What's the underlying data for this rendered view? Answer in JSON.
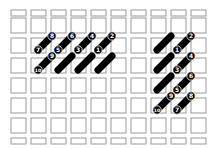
{
  "diagram": {
    "grid": {
      "cols": 10,
      "rows": 7,
      "origin_x": 9,
      "origin_y": 10,
      "pitch": 20,
      "cell": 15
    },
    "colors": {
      "grid": "#9a9a9a",
      "stitch": "#000000",
      "label_bg": "#000000",
      "label_text": "#ffffff"
    },
    "left_group": {
      "stitches": [
        {
          "x1": 38,
          "y1": 50,
          "x2": 52,
          "y2": 36,
          "start": "7",
          "end": "8"
        },
        {
          "x1": 58,
          "y1": 50,
          "x2": 72,
          "y2": 36,
          "start": "5",
          "end": "6"
        },
        {
          "x1": 78,
          "y1": 50,
          "x2": 92,
          "y2": 36,
          "start": "3",
          "end": "4"
        },
        {
          "x1": 98,
          "y1": 50,
          "x2": 112,
          "y2": 36,
          "start": "1",
          "end": "2"
        },
        {
          "x1": 38,
          "y1": 70,
          "x2": 52,
          "y2": 56,
          "start": "10",
          "end": "9"
        },
        {
          "x1": 58,
          "y1": 70,
          "x2": 72,
          "y2": 56,
          "start": "",
          "end": ""
        },
        {
          "x1": 78,
          "y1": 70,
          "x2": 92,
          "y2": 56,
          "start": "",
          "end": ""
        },
        {
          "x1": 98,
          "y1": 70,
          "x2": 112,
          "y2": 56,
          "start": "",
          "end": ""
        }
      ]
    },
    "right_group": {
      "stitches": [
        {
          "x1": 157,
          "y1": 50,
          "x2": 171,
          "y2": 36,
          "start": "",
          "end": ""
        },
        {
          "x1": 177,
          "y1": 50,
          "x2": 191,
          "y2": 36,
          "start": "1",
          "end": "2"
        },
        {
          "x1": 157,
          "y1": 70,
          "x2": 171,
          "y2": 56,
          "start": "",
          "end": ""
        },
        {
          "x1": 177,
          "y1": 70,
          "x2": 191,
          "y2": 56,
          "start": "3",
          "end": "4"
        },
        {
          "x1": 157,
          "y1": 90,
          "x2": 171,
          "y2": 76,
          "start": "",
          "end": ""
        },
        {
          "x1": 177,
          "y1": 90,
          "x2": 191,
          "y2": 76,
          "start": "5",
          "end": "6"
        },
        {
          "x1": 157,
          "y1": 110,
          "x2": 171,
          "y2": 96,
          "start": "10",
          "end": "9"
        },
        {
          "x1": 177,
          "y1": 110,
          "x2": 191,
          "y2": 96,
          "start": "7",
          "end": "8"
        }
      ]
    }
  }
}
